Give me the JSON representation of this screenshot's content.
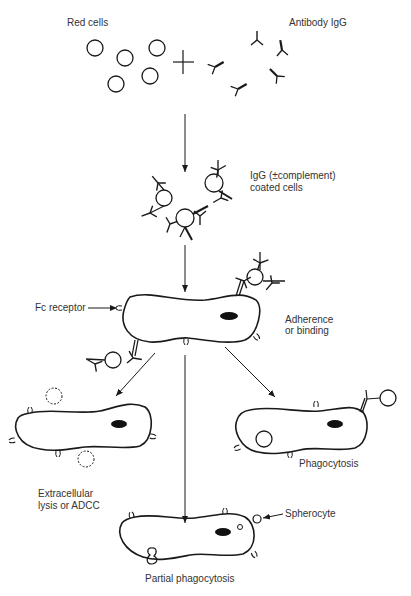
{
  "diagram": {
    "labels": {
      "red_cells": "Red cells",
      "antibody": "Antibody IgG",
      "coated_line1": "IgG (±complement)",
      "coated_line2": "coated cells",
      "fc_receptor": "Fc receptor",
      "adherence_line1": "Adherence",
      "adherence_line2": "or binding",
      "phagocytosis": "Phagocytosis",
      "extracellular_line1": "Extracellular",
      "extracellular_line2": "lysis or ADCC",
      "spherocyte": "Spherocyte",
      "partial": "Partial phagocytosis"
    },
    "colors": {
      "line": "#1a1a1a",
      "nucleus": "#111111",
      "background": "#ffffff"
    }
  }
}
